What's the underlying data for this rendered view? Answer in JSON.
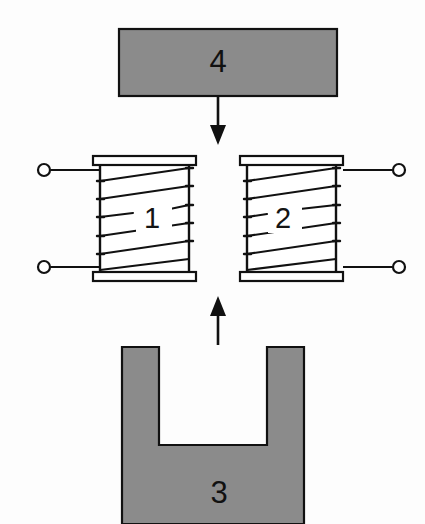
{
  "figure": {
    "width": 425,
    "height": 524,
    "background_color": "#fdfdfd",
    "stroke_color": "#111111",
    "fill_gray": "#8b8b8b",
    "bobbin_fill": "#ffffff"
  },
  "parts": [
    {
      "id": "coil-left",
      "number": "1",
      "type": "coil-winding",
      "label_x": 152,
      "label_y": 219
    },
    {
      "id": "coil-right",
      "number": "2",
      "type": "coil-winding",
      "label_x": 283,
      "label_y": 219
    },
    {
      "id": "yoke-core",
      "number": "3",
      "type": "u-shaped-core",
      "label_x": 219,
      "label_y": 496
    },
    {
      "id": "armature-bar",
      "number": "4",
      "type": "rectangular-bar",
      "label_x": 218,
      "label_y": 63
    }
  ],
  "arrows": [
    {
      "id": "arrow-down",
      "direction": "down",
      "from_part": "4",
      "to_part": "coil-gap",
      "x": 218,
      "y_start": 97,
      "y_end": 143
    },
    {
      "id": "arrow-up",
      "direction": "up",
      "from_part": "3",
      "to_part": "coil-gap",
      "x": 218,
      "y_start": 345,
      "y_end": 297
    }
  ],
  "terminals": [
    {
      "id": "terminal-left-top",
      "cx": 44,
      "cy": 170,
      "side": "left"
    },
    {
      "id": "terminal-left-bottom",
      "cx": 44,
      "cy": 267,
      "side": "left"
    },
    {
      "id": "terminal-right-top",
      "cx": 399,
      "cy": 170,
      "side": "right"
    },
    {
      "id": "terminal-right-bottom",
      "cx": 399,
      "cy": 267,
      "side": "right"
    }
  ],
  "geometry": {
    "bar4": {
      "x": 119,
      "y": 29,
      "w": 218,
      "h": 67
    },
    "coil_left": {
      "x": 93,
      "y": 156,
      "w": 103,
      "h": 125
    },
    "coil_right": {
      "x": 240,
      "y": 156,
      "w": 103,
      "h": 125
    },
    "yoke": {
      "outer_x": 122,
      "outer_y": 347,
      "outer_w": 182,
      "outer_h": 177,
      "slot_x": 159,
      "slot_y": 347,
      "slot_w": 52,
      "slot_h": 98
    },
    "winding_turns": 6
  }
}
